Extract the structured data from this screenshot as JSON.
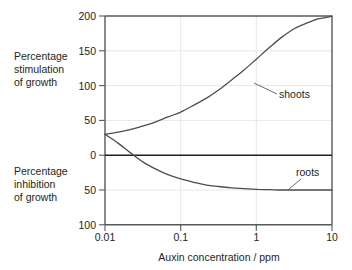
{
  "chart_data": {
    "type": "line",
    "title": "",
    "xlabel": "Auxin concentration / ppm",
    "ylabel": "",
    "xscale": "log",
    "xlim": [
      0.01,
      10
    ],
    "ylim": [
      -100,
      200
    ],
    "grid": true,
    "legend_position": "inline-annotation",
    "x_tick_labels": [
      "0.01",
      "0.1",
      "1",
      "10"
    ],
    "x_tick_values": [
      0.01,
      0.1,
      1,
      10
    ],
    "y_tick_labels": [
      "200",
      "150",
      "100",
      "50",
      "0",
      "50",
      "100"
    ],
    "y_tick_values": [
      200,
      150,
      100,
      50,
      0,
      -50,
      -100
    ],
    "axis_region_labels": {
      "upper": "Percentage\nstimulation\nof growth",
      "lower": "Percentage\ninhibition\nof growth"
    },
    "series": [
      {
        "name": "shoots",
        "label": "shoots",
        "x": [
          0.01,
          0.015,
          0.022,
          0.032,
          0.047,
          0.068,
          0.1,
          0.15,
          0.22,
          0.32,
          0.47,
          0.68,
          1.0,
          1.5,
          2.2,
          3.2,
          4.7,
          5.5,
          6.5,
          7.5,
          8.5,
          10
        ],
        "values": [
          30,
          33,
          37,
          42,
          48,
          55,
          62,
          72,
          82,
          94,
          108,
          122,
          138,
          155,
          170,
          182,
          190,
          193,
          196,
          197,
          198,
          200
        ]
      },
      {
        "name": "roots",
        "label": "roots",
        "x": [
          0.01,
          0.015,
          0.022,
          0.032,
          0.047,
          0.068,
          0.1,
          0.15,
          0.22,
          0.32,
          0.47,
          0.68,
          1.0,
          1.5,
          2.2,
          3.2,
          4.7,
          6.8,
          10
        ],
        "values": [
          30,
          17,
          3,
          -10,
          -20,
          -28,
          -34,
          -39,
          -43,
          -45,
          -47,
          -48,
          -49,
          -49.5,
          -50,
          -50,
          -50,
          -50,
          -50
        ]
      }
    ],
    "annotations": [
      {
        "text": "shoots",
        "for_series": "shoots"
      },
      {
        "text": "roots",
        "for_series": "roots"
      }
    ],
    "colors": {
      "curve": "#4d4d4f",
      "axis": "#58595b",
      "grid": "#e8e8e8",
      "zero_line": "#231f20",
      "text": "#231f20",
      "background": "#ffffff"
    }
  }
}
